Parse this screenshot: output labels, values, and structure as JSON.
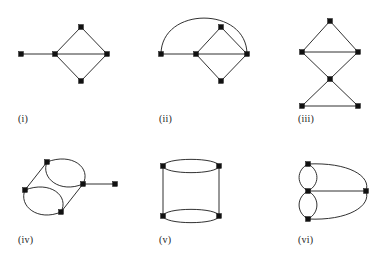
{
  "figure": {
    "title": "",
    "background_color": "#ffffff",
    "edge_color": "#1a1a1a",
    "vertex_color": "#111111",
    "panel_count": 6
  },
  "panels": [
    {
      "id": "panel-i",
      "label": "(i)",
      "label_x": 18,
      "label_y": 117,
      "description": "pendant vertex attached to a diamond with horizontal diagonal",
      "vertex_count": 5,
      "edge_count": 5
    },
    {
      "id": "panel-ii",
      "label": "(ii)",
      "label_x": 159,
      "label_y": 117,
      "description": "diamond with horizontal diagonal plus pendant vertex joined by a large arc",
      "vertex_count": 5,
      "edge_count": 6
    },
    {
      "id": "panel-iii",
      "label": "(iii)",
      "label_x": 298,
      "label_y": 117,
      "description": "two triangles meeting at a crossing centre vertex (bowtie-like)",
      "vertex_count": 5,
      "edge_count": 6
    },
    {
      "id": "panel-iv",
      "label": "(iv)",
      "label_x": 18,
      "label_y": 238,
      "description": "tilted cylinder of four vertices with two double-edge ellipses and a pendant vertex",
      "vertex_count": 5,
      "edge_count": 7
    },
    {
      "id": "panel-v",
      "label": "(v)",
      "label_x": 159,
      "label_y": 238,
      "description": "upright cylinder: four vertices, two double-edge ellipses, two straight side edges",
      "vertex_count": 4,
      "edge_count": 6
    },
    {
      "id": "panel-vi",
      "label": "(vi)",
      "label_x": 298,
      "label_y": 238,
      "description": "centre vertex with two vertical double-edge loops and two large arcs to a right vertex",
      "vertex_count": 4,
      "edge_count": 7
    }
  ],
  "graph_geometry": {
    "panel_i": {
      "vertices": [
        {
          "name": "i-left",
          "x": 21,
          "y": 54
        },
        {
          "name": "i-center",
          "x": 55,
          "y": 54
        },
        {
          "name": "i-top",
          "x": 81,
          "y": 27
        },
        {
          "name": "i-right",
          "x": 107,
          "y": 54
        },
        {
          "name": "i-bottom",
          "x": 81,
          "y": 81
        }
      ]
    },
    "panel_ii": {
      "vertices": [
        {
          "name": "ii-left",
          "x": 161,
          "y": 54
        },
        {
          "name": "ii-center",
          "x": 196,
          "y": 54
        },
        {
          "name": "ii-top",
          "x": 221,
          "y": 27
        },
        {
          "name": "ii-right",
          "x": 247,
          "y": 54
        },
        {
          "name": "ii-bottom",
          "x": 221,
          "y": 81
        }
      ]
    },
    "panel_iii": {
      "vertices": [
        {
          "name": "iii-top",
          "x": 330,
          "y": 21
        },
        {
          "name": "iii-upper-left",
          "x": 302,
          "y": 52
        },
        {
          "name": "iii-upper-right",
          "x": 358,
          "y": 52
        },
        {
          "name": "iii-center",
          "x": 330,
          "y": 79
        },
        {
          "name": "iii-lower-left",
          "x": 302,
          "y": 106
        },
        {
          "name": "iii-lower-right",
          "x": 358,
          "y": 106
        }
      ]
    },
    "panel_iv": {
      "vertices": [
        {
          "name": "iv-back-top",
          "x": 47,
          "y": 162
        },
        {
          "name": "iv-back-bottom",
          "x": 25,
          "y": 190
        },
        {
          "name": "iv-front-top",
          "x": 83,
          "y": 184
        },
        {
          "name": "iv-front-bottom",
          "x": 61,
          "y": 212
        },
        {
          "name": "iv-pendant",
          "x": 115,
          "y": 184
        }
      ]
    },
    "panel_v": {
      "vertices": [
        {
          "name": "v-top-left",
          "x": 163,
          "y": 166
        },
        {
          "name": "v-top-right",
          "x": 219,
          "y": 166
        },
        {
          "name": "v-bottom-left",
          "x": 163,
          "y": 216
        },
        {
          "name": "v-bottom-right",
          "x": 219,
          "y": 216
        }
      ]
    },
    "panel_vi": {
      "vertices": [
        {
          "name": "vi-top",
          "x": 308,
          "y": 164
        },
        {
          "name": "vi-center",
          "x": 308,
          "y": 191
        },
        {
          "name": "vi-bottom",
          "x": 308,
          "y": 219
        },
        {
          "name": "vi-right",
          "x": 366,
          "y": 191
        }
      ]
    }
  }
}
